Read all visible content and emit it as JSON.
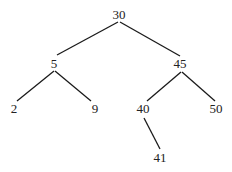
{
  "diagram": {
    "type": "binary-tree",
    "colors": {
      "line": "#1a1a1a",
      "text": "#222222",
      "background": "#ffffff"
    },
    "nodes": [
      {
        "id": "n30",
        "label": "30",
        "x": 119,
        "y": 19
      },
      {
        "id": "n5",
        "label": "5",
        "x": 54,
        "y": 68
      },
      {
        "id": "n45",
        "label": "45",
        "x": 180,
        "y": 68
      },
      {
        "id": "n2",
        "label": "2",
        "x": 14,
        "y": 113
      },
      {
        "id": "n9",
        "label": "9",
        "x": 95,
        "y": 113
      },
      {
        "id": "n40",
        "label": "40",
        "x": 143,
        "y": 113
      },
      {
        "id": "n50",
        "label": "50",
        "x": 216,
        "y": 113
      },
      {
        "id": "n41",
        "label": "41",
        "x": 160,
        "y": 162
      }
    ],
    "edges": [
      {
        "from": "30",
        "to": "5"
      },
      {
        "from": "30",
        "to": "45"
      },
      {
        "from": "5",
        "to": "2"
      },
      {
        "from": "5",
        "to": "9"
      },
      {
        "from": "45",
        "to": "40"
      },
      {
        "from": "45",
        "to": "50"
      },
      {
        "from": "40",
        "to": "41"
      }
    ]
  }
}
